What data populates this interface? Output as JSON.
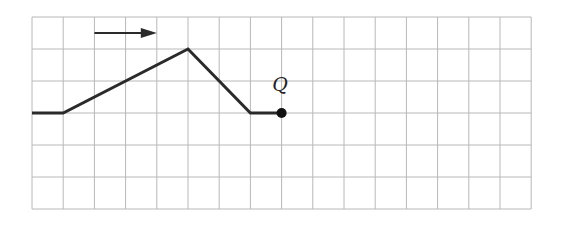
{
  "diagram": {
    "title": "",
    "grid": {
      "cols": 16,
      "rows": 6,
      "origin_px": [
        32,
        17
      ],
      "cell_w": 31.2,
      "cell_h": 32,
      "line_color": "#b8b8b8"
    },
    "path": {
      "points": [
        [
          0,
          3
        ],
        [
          1,
          3
        ],
        [
          5,
          1
        ],
        [
          7,
          3
        ],
        [
          8,
          3
        ]
      ],
      "stroke": "#2a2a2a",
      "width": 3
    },
    "arrow": {
      "from": [
        2,
        0.5
      ],
      "to": [
        4,
        0.5
      ],
      "direction": "right",
      "color": "#2a2a2a"
    },
    "point": {
      "label": "Q",
      "at": [
        8,
        3
      ],
      "label_at": [
        7.7,
        2.3
      ],
      "color": "#111111"
    }
  }
}
